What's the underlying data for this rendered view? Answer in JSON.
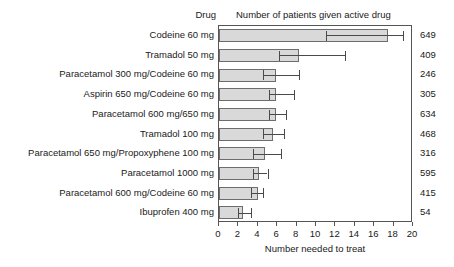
{
  "header": {
    "drug_column_label": "Drug",
    "count_column_label": "Number of patients given active drug"
  },
  "axis": {
    "x_title": "Number needed to treat",
    "ticks": [
      0,
      2,
      4,
      6,
      8,
      10,
      12,
      14,
      16,
      18,
      20
    ]
  },
  "colors": {
    "bar_fill": "#d9d9d9",
    "bar_stroke": "#6d6d6d",
    "error_bar": "#4a4a4a",
    "frame": "#555555",
    "text": "#1a1a1a"
  },
  "chart_data": {
    "type": "bar",
    "orientation": "horizontal",
    "title": "",
    "xlabel": "Number needed to treat",
    "ylabel": "Drug",
    "xlim": [
      0,
      20
    ],
    "xticks": [
      0,
      2,
      4,
      6,
      8,
      10,
      12,
      14,
      16,
      18,
      20
    ],
    "grid": false,
    "legend": "none",
    "categories": [
      "Codeine 60 mg",
      "Tramadol 50 mg",
      "Paracetamol 300 mg/Codeine 60 mg",
      "Aspirin 650 mg/Codeine 60 mg",
      "Paracetamol 600 mg/650 mg",
      "Tramadol 100 mg",
      "Paracetamol 650 mg/Propoxyphene 100 mg",
      "Paracetamol 1000 mg",
      "Paracetamol 600 mg/Codeine 60 mg",
      "Ibuprofen 400 mg"
    ],
    "values": [
      17.4,
      8.2,
      5.9,
      5.9,
      5.9,
      5.6,
      4.7,
      4.1,
      4.0,
      2.5
    ],
    "error_low": [
      11.0,
      6.2,
      4.5,
      5.2,
      5.2,
      4.5,
      3.5,
      3.5,
      3.3,
      2.0
    ],
    "error_high": [
      19.0,
      13.0,
      8.2,
      7.7,
      6.9,
      6.7,
      6.4,
      5.0,
      4.5,
      3.3
    ],
    "right_axis_label": "Number of patients given active drug",
    "right_values": [
      649,
      409,
      246,
      305,
      634,
      468,
      316,
      595,
      415,
      54
    ],
    "rows": [
      {
        "label": "Codeine 60 mg",
        "value": 17.4,
        "low": 11.0,
        "high": 19.0,
        "patients": 649
      },
      {
        "label": "Tramadol 50 mg",
        "value": 8.2,
        "low": 6.2,
        "high": 13.0,
        "patients": 409
      },
      {
        "label": "Paracetamol 300 mg/Codeine 60 mg",
        "value": 5.9,
        "low": 4.5,
        "high": 8.2,
        "patients": 246
      },
      {
        "label": "Aspirin 650 mg/Codeine 60 mg",
        "value": 5.9,
        "low": 5.2,
        "high": 7.7,
        "patients": 305
      },
      {
        "label": "Paracetamol 600 mg/650 mg",
        "value": 5.9,
        "low": 5.2,
        "high": 6.9,
        "patients": 634
      },
      {
        "label": "Tramadol 100 mg",
        "value": 5.6,
        "low": 4.5,
        "high": 6.7,
        "patients": 468
      },
      {
        "label": "Paracetamol 650 mg/Propoxyphene 100 mg",
        "value": 4.7,
        "low": 3.5,
        "high": 6.4,
        "patients": 316
      },
      {
        "label": "Paracetamol 1000 mg",
        "value": 4.1,
        "low": 3.5,
        "high": 5.0,
        "patients": 595
      },
      {
        "label": "Paracetamol 600 mg/Codeine 60 mg",
        "value": 4.0,
        "low": 3.3,
        "high": 4.5,
        "patients": 415
      },
      {
        "label": "Ibuprofen 400 mg",
        "value": 2.5,
        "low": 2.0,
        "high": 3.3,
        "patients": 54
      }
    ]
  }
}
